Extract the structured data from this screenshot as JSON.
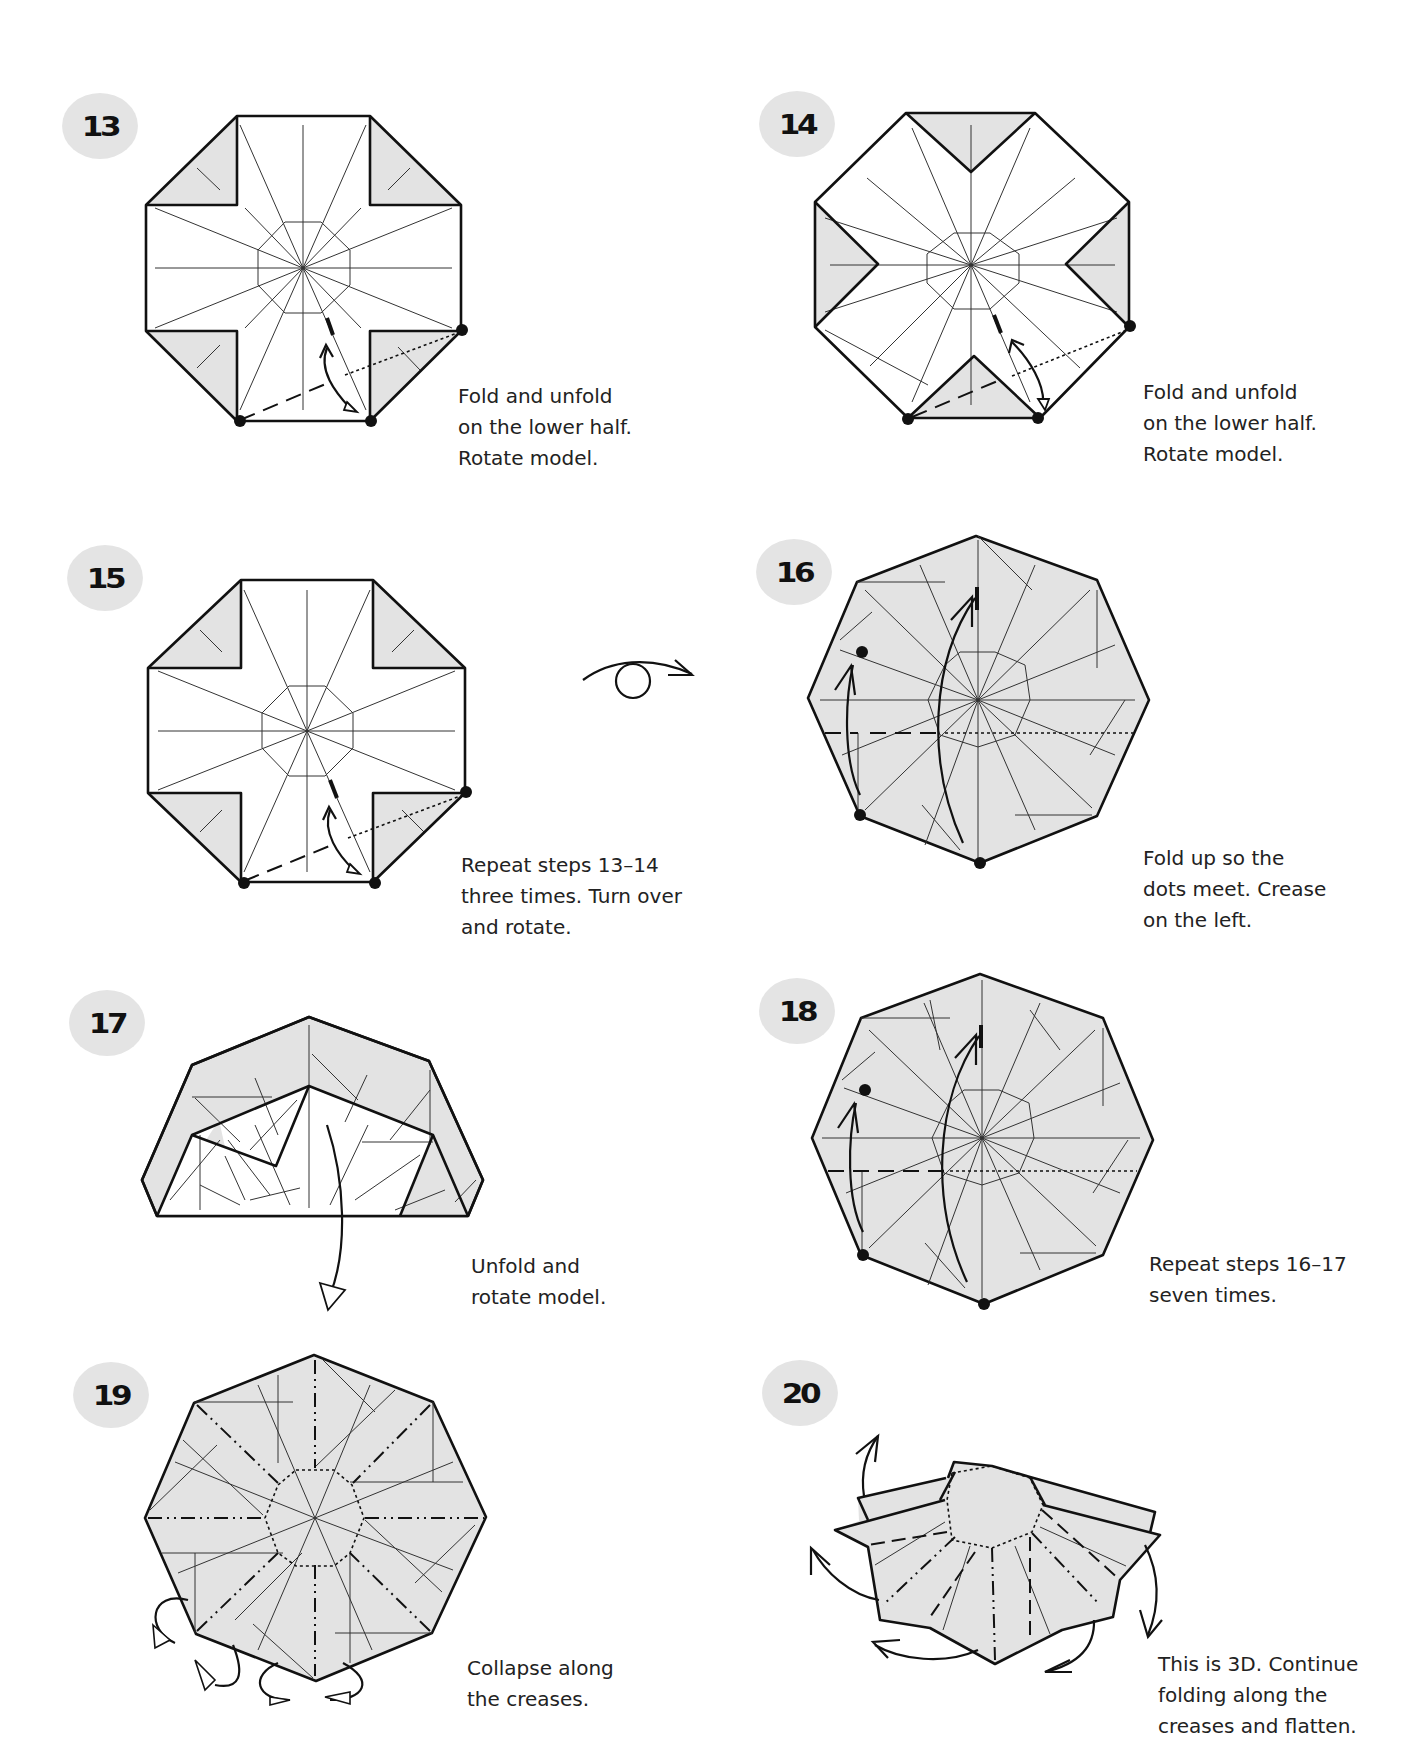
{
  "page": {
    "background": "#ffffff",
    "badge_color": "#e4e4e4",
    "paper_shade": "#e3e3e3"
  },
  "steps": [
    {
      "number": "13",
      "caption": "Fold and unfold\non the lower half.\nRotate model.",
      "symbols": [
        "dot-marker",
        "fold-unfold-arrow",
        "valley-fold-line",
        "x-ray-line"
      ]
    },
    {
      "number": "14",
      "caption": "Fold and unfold\non the lower half.\nRotate model.",
      "symbols": [
        "dot-marker",
        "fold-unfold-arrow",
        "valley-fold-line",
        "x-ray-line"
      ]
    },
    {
      "number": "15",
      "caption": "Repeat steps 13–14\nthree times. Turn over\nand rotate.",
      "symbols": [
        "dot-marker",
        "fold-unfold-arrow",
        "valley-fold-line",
        "turn-over-symbol"
      ]
    },
    {
      "number": "16",
      "caption": "Fold up so the\ndots meet. Crease\non the left.",
      "symbols": [
        "dot-marker",
        "fold-arrow",
        "valley-fold-line",
        "x-ray-line"
      ]
    },
    {
      "number": "17",
      "caption": "Unfold and\nrotate model.",
      "symbols": [
        "unfold-arrow"
      ]
    },
    {
      "number": "18",
      "caption": "Repeat steps 16–17\nseven times.",
      "symbols": [
        "dot-marker",
        "fold-arrow",
        "valley-fold-line",
        "x-ray-line"
      ]
    },
    {
      "number": "19",
      "caption": "Collapse along\nthe creases.",
      "symbols": [
        "mountain-fold-line",
        "valley-fold-line",
        "push-arrow"
      ]
    },
    {
      "number": "20",
      "caption": "This is 3D. Continue\nfolding along the\ncreases and flatten.",
      "symbols": [
        "mountain-fold-line",
        "valley-fold-line",
        "rotate-arrow"
      ]
    }
  ],
  "symbols": {
    "turn_over": "turn-over-icon"
  }
}
